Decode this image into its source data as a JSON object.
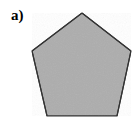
{
  "figure": {
    "panel_label": "a)",
    "background_color": "#ffffff",
    "shape": {
      "name": "pentagon",
      "sides": 5,
      "fill_color": "#adadad",
      "stroke_color": "#333333",
      "stroke_width": 1.2,
      "vertices": [
        [
          82,
          13
        ],
        [
          131,
          51
        ],
        [
          117,
          116
        ],
        [
          47,
          116
        ],
        [
          32,
          51
        ]
      ],
      "points_attr": "82,13 131,51 117,116 47,116 32,51"
    }
  }
}
